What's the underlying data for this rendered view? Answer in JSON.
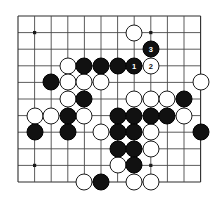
{
  "diagram": {
    "kind": "go-board-diagram",
    "board": {
      "cols": 12,
      "rows": 11,
      "origin_x": 18,
      "origin_y": 16,
      "spacing": 16.6,
      "line_color": "#4a4a4a",
      "edge_color": "#2c2c2c",
      "background_color": "#ffffff",
      "black_color": "#111111",
      "white_color": "#ffffff"
    },
    "star_points": [
      {
        "col": 1,
        "row": 1
      },
      {
        "col": 8,
        "row": 1
      },
      {
        "col": 1,
        "row": 9
      },
      {
        "col": 8,
        "row": 9
      }
    ],
    "stones": [
      {
        "col": 7,
        "row": 1,
        "color": "white",
        "label": ""
      },
      {
        "col": 8,
        "row": 2,
        "color": "black",
        "label": "3"
      },
      {
        "col": 3,
        "row": 3,
        "color": "white",
        "label": ""
      },
      {
        "col": 4,
        "row": 3,
        "color": "black",
        "label": ""
      },
      {
        "col": 5,
        "row": 3,
        "color": "black",
        "label": ""
      },
      {
        "col": 6,
        "row": 3,
        "color": "black",
        "label": ""
      },
      {
        "col": 7,
        "row": 3,
        "color": "black",
        "label": "1"
      },
      {
        "col": 8,
        "row": 3,
        "color": "white",
        "label": "2"
      },
      {
        "col": 2,
        "row": 4,
        "color": "black",
        "label": ""
      },
      {
        "col": 3,
        "row": 4,
        "color": "white",
        "label": ""
      },
      {
        "col": 4,
        "row": 4,
        "color": "white",
        "label": ""
      },
      {
        "col": 5,
        "row": 4,
        "color": "white",
        "label": ""
      },
      {
        "col": 11,
        "row": 4,
        "color": "white",
        "label": ""
      },
      {
        "col": 3,
        "row": 5,
        "color": "white",
        "label": ""
      },
      {
        "col": 4,
        "row": 5,
        "color": "black",
        "label": ""
      },
      {
        "col": 7,
        "row": 5,
        "color": "white",
        "label": ""
      },
      {
        "col": 8,
        "row": 5,
        "color": "white",
        "label": ""
      },
      {
        "col": 9,
        "row": 5,
        "color": "white",
        "label": ""
      },
      {
        "col": 10,
        "row": 5,
        "color": "black",
        "label": ""
      },
      {
        "col": 1,
        "row": 6,
        "color": "white",
        "label": ""
      },
      {
        "col": 2,
        "row": 6,
        "color": "white",
        "label": ""
      },
      {
        "col": 3,
        "row": 6,
        "color": "black",
        "label": ""
      },
      {
        "col": 4,
        "row": 6,
        "color": "white",
        "label": ""
      },
      {
        "col": 6,
        "row": 6,
        "color": "black",
        "label": ""
      },
      {
        "col": 7,
        "row": 6,
        "color": "black",
        "label": ""
      },
      {
        "col": 8,
        "row": 6,
        "color": "black",
        "label": ""
      },
      {
        "col": 9,
        "row": 6,
        "color": "black",
        "label": ""
      },
      {
        "col": 10,
        "row": 6,
        "color": "white",
        "label": ""
      },
      {
        "col": 1,
        "row": 7,
        "color": "black",
        "label": ""
      },
      {
        "col": 3,
        "row": 7,
        "color": "black",
        "label": ""
      },
      {
        "col": 5,
        "row": 7,
        "color": "white",
        "label": ""
      },
      {
        "col": 6,
        "row": 7,
        "color": "black",
        "label": ""
      },
      {
        "col": 7,
        "row": 7,
        "color": "black",
        "label": ""
      },
      {
        "col": 8,
        "row": 7,
        "color": "white",
        "label": ""
      },
      {
        "col": 11,
        "row": 7,
        "color": "black",
        "label": ""
      },
      {
        "col": 6,
        "row": 8,
        "color": "black",
        "label": ""
      },
      {
        "col": 7,
        "row": 8,
        "color": "black",
        "label": ""
      },
      {
        "col": 8,
        "row": 8,
        "color": "white",
        "label": ""
      },
      {
        "col": 6,
        "row": 9,
        "color": "white",
        "label": ""
      },
      {
        "col": 7,
        "row": 9,
        "color": "black",
        "label": ""
      },
      {
        "col": 4,
        "row": 10,
        "color": "white",
        "label": ""
      },
      {
        "col": 5,
        "row": 10,
        "color": "black",
        "label": ""
      },
      {
        "col": 7,
        "row": 10,
        "color": "white",
        "label": ""
      },
      {
        "col": 8,
        "row": 10,
        "color": "white",
        "label": ""
      }
    ],
    "move_markers": [
      {
        "number": "1",
        "color": "black",
        "col": 7,
        "row": 3
      },
      {
        "number": "2",
        "color": "white",
        "col": 8,
        "row": 3
      },
      {
        "number": "3",
        "color": "black",
        "col": 8,
        "row": 2
      }
    ]
  }
}
